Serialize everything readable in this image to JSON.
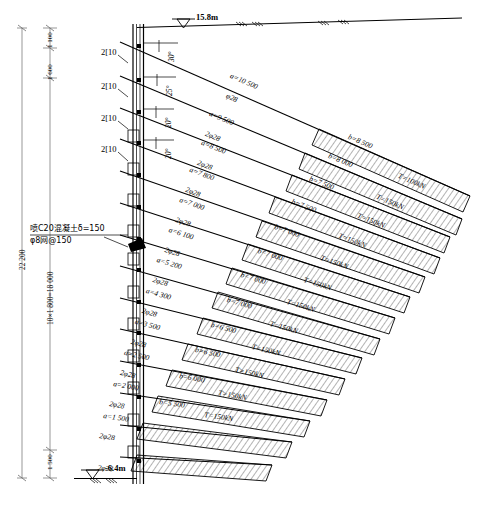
{
  "drawing": {
    "title_type": "anchored-retaining-wall-section",
    "top_elevation": "15.8m",
    "bottom_elevation": "-6.4m",
    "total_depth": "22 200",
    "spacing_note": "10×1 800=18 000",
    "dim_top_1": "1 100",
    "dim_top_2": "1 600",
    "dim_bottom": "1 500",
    "shotcrete_note": "喷C20混凝土δ=150",
    "mesh_note": "φ8网@150",
    "waler_label": "2[10",
    "waler_count": 4
  },
  "walers": [
    {
      "label": "2[10"
    },
    {
      "label": "2[10"
    },
    {
      "label": "2[10"
    },
    {
      "label": "2[10"
    }
  ],
  "angles": [
    "30°",
    "25°",
    "20°",
    "20°"
  ],
  "anchors": [
    {
      "n": 1,
      "free_len": "a=10 500",
      "bar": "φ28",
      "bond_len": "b=8 500",
      "force": "T=100kN"
    },
    {
      "n": 2,
      "free_len": "a=9 500",
      "bar": "2φ28",
      "bond_len": "b=8 000",
      "force": "T=150kN"
    },
    {
      "n": 3,
      "free_len": "a=8 500",
      "bar": "2φ28",
      "bond_len": "b=7 500",
      "force": "T=150kN"
    },
    {
      "n": 4,
      "free_len": "a=7 800",
      "bar": "2φ28",
      "bond_len": "b=7 500",
      "force": "T=150kN"
    },
    {
      "n": 5,
      "free_len": "a=7 000",
      "bar": "2φ28",
      "bond_len": "b=7 000",
      "force": "T=150kN"
    },
    {
      "n": 6,
      "free_len": "a=6 100",
      "bar": "2φ28",
      "bond_len": "b=7 000",
      "force": "T=150kN"
    },
    {
      "n": 7,
      "free_len": "a=5 200",
      "bar": "2φ28",
      "bond_len": "b=7 000",
      "force": "T=150kN"
    },
    {
      "n": 8,
      "free_len": "a=4 300",
      "bar": "2φ28",
      "bond_len": "b=7 000",
      "force": "T=150kN"
    },
    {
      "n": 9,
      "free_len": "a=3 500",
      "bar": "2φ28",
      "bond_len": "b=6 500",
      "force": "T=150kN"
    },
    {
      "n": 10,
      "free_len": "a=2 500",
      "bar": "2φ28",
      "bond_len": "b=6 500",
      "force": "T=150kN"
    },
    {
      "n": 11,
      "free_len": "a=2 000",
      "bar": "2φ28",
      "bond_len": "b=6 000",
      "force": "T=150kN"
    },
    {
      "n": 12,
      "free_len": "a=1 500",
      "bar": "2φ28",
      "bond_len": "b=5 500",
      "force": "T=150kN"
    },
    {
      "n": 13,
      "free_len": "",
      "bar": "2φ28",
      "bond_len": "",
      "force": ""
    }
  ],
  "colors": {
    "line": "#000000",
    "background": "#ffffff",
    "dim": "#6b6b6b"
  }
}
